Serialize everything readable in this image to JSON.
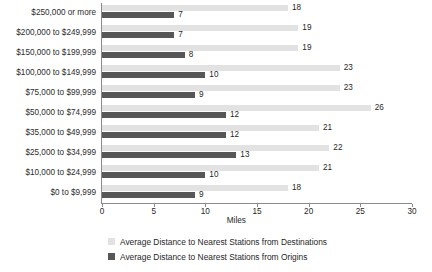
{
  "chart_data": {
    "type": "bar",
    "orientation": "horizontal",
    "title": "",
    "xlabel": "Miles",
    "ylabel": "",
    "xlim": [
      0,
      30
    ],
    "xticks": [
      0,
      5,
      10,
      15,
      20,
      25,
      30
    ],
    "grid": false,
    "legend_position": "bottom",
    "categories": [
      "$250,000 or more",
      "$200,000 to $249,999",
      "$150,000 to $199,999",
      "$100,000 to $149,999",
      "$75,000 to $99,999",
      "$50,000 to $74,999",
      "$35,000 to $49,999",
      "$25,000 to $34,999",
      "$10,000 to $24,999",
      "$0 to $9,999"
    ],
    "series": [
      {
        "name": "Average Distance to Nearest Stations from Destinations",
        "color": "#e2e2e2",
        "values": [
          18,
          19,
          19,
          23,
          23,
          26,
          21,
          22,
          21,
          18
        ]
      },
      {
        "name": "Average Distance to Nearest Stations from Origins",
        "color": "#575757",
        "values": [
          7,
          7,
          8,
          10,
          9,
          12,
          12,
          13,
          10,
          9
        ]
      }
    ]
  },
  "legend": {
    "items": [
      {
        "label": "Average Distance to Nearest Stations from Destinations",
        "swatch": "light-gray-swatch-icon"
      },
      {
        "label": "Average Distance to Nearest Stations from Origins",
        "swatch": "dark-gray-swatch-icon"
      }
    ]
  },
  "colors": {
    "series_light": "#e2e2e2",
    "series_dark": "#575757",
    "axis": "#8a8a8a",
    "text": "#1f1f1f",
    "background": "#ffffff"
  }
}
